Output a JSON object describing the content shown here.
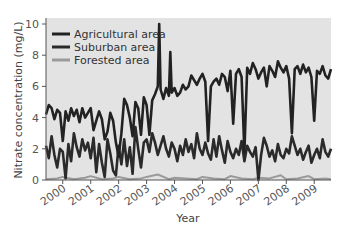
{
  "chart_data": {
    "type": "line",
    "title": "",
    "xlabel": "Year",
    "ylabel": "Nitrate concentration (mg/L)",
    "ylim": [
      0,
      10
    ],
    "yticks": [
      0,
      2,
      4,
      6,
      8,
      10
    ],
    "xlim": [
      1999.4,
      2009.6
    ],
    "xticks": [
      2000,
      2001,
      2002,
      2003,
      2004,
      2005,
      2006,
      2007,
      2008,
      2009
    ],
    "grid": false,
    "background": "#e3e3e3",
    "legend_position": "upper left",
    "series": [
      {
        "name": "Agricultural area",
        "color": "#222222",
        "x": [
          1999.4,
          1999.5,
          1999.6,
          1999.7,
          1999.8,
          1999.9,
          2000.0,
          2000.1,
          2000.2,
          2000.3,
          2000.4,
          2000.5,
          2000.6,
          2000.7,
          2000.8,
          2000.9,
          2001.0,
          2001.1,
          2001.2,
          2001.3,
          2001.4,
          2001.5,
          2001.6,
          2001.7,
          2001.8,
          2001.9,
          2002.0,
          2002.1,
          2002.2,
          2002.3,
          2002.4,
          2002.5,
          2002.6,
          2002.7,
          2002.8,
          2002.9,
          2003.0,
          2003.1,
          2003.2,
          2003.3,
          2003.4,
          2003.45,
          2003.5,
          2003.6,
          2003.7,
          2003.8,
          2003.85,
          2003.9,
          2004.0,
          2004.1,
          2004.2,
          2004.3,
          2004.4,
          2004.5,
          2004.6,
          2004.7,
          2004.8,
          2004.9,
          2005.0,
          2005.1,
          2005.2,
          2005.3,
          2005.4,
          2005.5,
          2005.6,
          2005.7,
          2005.8,
          2005.9,
          2006.0,
          2006.1,
          2006.2,
          2006.3,
          2006.4,
          2006.5,
          2006.6,
          2006.7,
          2006.8,
          2006.9,
          2007.0,
          2007.1,
          2007.2,
          2007.3,
          2007.4,
          2007.5,
          2007.6,
          2007.7,
          2007.8,
          2007.9,
          2008.0,
          2008.1,
          2008.2,
          2008.3,
          2008.4,
          2008.5,
          2008.6,
          2008.7,
          2008.8,
          2008.9,
          2009.0,
          2009.1,
          2009.2,
          2009.3,
          2009.4,
          2009.5,
          2009.6
        ],
        "values": [
          4.2,
          4.8,
          4.6,
          3.9,
          4.5,
          4.3,
          2.5,
          4.4,
          3.8,
          4.6,
          4.1,
          4.5,
          3.7,
          4.6,
          4.0,
          4.3,
          4.6,
          3.2,
          3.8,
          4.4,
          3.9,
          2.6,
          3.1,
          4.3,
          3.8,
          2.4,
          1.5,
          3.0,
          5.2,
          4.8,
          4.0,
          2.8,
          5.0,
          4.6,
          2.9,
          5.3,
          4.8,
          2.9,
          5.1,
          5.5,
          6.0,
          10.0,
          5.8,
          5.2,
          5.9,
          5.4,
          8.2,
          5.6,
          5.9,
          5.4,
          5.6,
          6.1,
          5.8,
          6.0,
          6.7,
          6.4,
          6.1,
          6.5,
          6.8,
          6.3,
          2.5,
          6.0,
          6.3,
          6.5,
          6.1,
          6.8,
          6.6,
          5.7,
          7.0,
          3.6,
          6.8,
          7.1,
          6.6,
          1.8,
          7.2,
          6.8,
          7.5,
          7.1,
          6.5,
          6.9,
          7.2,
          6.0,
          7.3,
          7.0,
          6.6,
          7.6,
          7.2,
          6.9,
          7.3,
          6.5,
          3.0,
          7.1,
          7.3,
          6.8,
          7.4,
          6.9,
          7.2,
          6.6,
          3.8,
          7.0,
          6.8,
          7.3,
          6.7,
          6.5,
          7.1
        ],
        "note": "values approximate; series shows frequent downward spikes"
      },
      {
        "name": "Suburban area",
        "color": "#2a2a2a",
        "x": [
          1999.4,
          1999.5,
          1999.6,
          1999.7,
          1999.8,
          1999.9,
          2000.0,
          2000.1,
          2000.2,
          2000.3,
          2000.4,
          2000.5,
          2000.6,
          2000.7,
          2000.8,
          2000.9,
          2001.0,
          2001.1,
          2001.2,
          2001.3,
          2001.4,
          2001.5,
          2001.6,
          2001.7,
          2001.8,
          2001.9,
          2002.0,
          2002.1,
          2002.2,
          2002.3,
          2002.4,
          2002.5,
          2002.6,
          2002.7,
          2002.8,
          2002.9,
          2003.0,
          2003.1,
          2003.2,
          2003.3,
          2003.4,
          2003.5,
          2003.6,
          2003.7,
          2003.8,
          2003.9,
          2004.0,
          2004.1,
          2004.2,
          2004.3,
          2004.4,
          2004.5,
          2004.6,
          2004.7,
          2004.8,
          2004.9,
          2005.0,
          2005.1,
          2005.2,
          2005.3,
          2005.4,
          2005.5,
          2005.6,
          2005.7,
          2005.8,
          2005.9,
          2006.0,
          2006.1,
          2006.2,
          2006.3,
          2006.4,
          2006.5,
          2006.6,
          2006.7,
          2006.8,
          2006.9,
          2007.0,
          2007.1,
          2007.2,
          2007.3,
          2007.4,
          2007.5,
          2007.6,
          2007.7,
          2007.8,
          2007.9,
          2008.0,
          2008.1,
          2008.2,
          2008.3,
          2008.4,
          2008.5,
          2008.6,
          2008.7,
          2008.8,
          2008.9,
          2009.0,
          2009.1,
          2009.2,
          2009.3,
          2009.4,
          2009.5,
          2009.6
        ],
        "values": [
          2.2,
          1.4,
          2.8,
          1.6,
          0.8,
          2.0,
          1.8,
          0.1,
          2.3,
          1.2,
          3.0,
          2.1,
          1.5,
          2.6,
          1.9,
          2.4,
          1.4,
          2.7,
          0.5,
          2.3,
          1.1,
          0.2,
          2.6,
          1.7,
          0.6,
          0.3,
          2.2,
          1.0,
          2.6,
          0.9,
          2.1,
          0.4,
          3.4,
          2.0,
          0.8,
          2.4,
          2.6,
          1.8,
          3.0,
          2.4,
          1.6,
          2.2,
          2.8,
          2.0,
          1.5,
          2.4,
          2.0,
          1.2,
          2.2,
          1.6,
          2.6,
          1.8,
          2.3,
          1.4,
          3.0,
          2.0,
          1.6,
          2.4,
          1.7,
          1.3,
          2.6,
          1.5,
          2.8,
          1.9,
          1.1,
          2.5,
          1.8,
          1.4,
          2.0,
          1.6,
          2.5,
          1.2,
          2.2,
          1.8,
          1.5,
          2.1,
          0.0,
          1.6,
          2.7,
          2.2,
          1.5,
          1.9,
          1.2,
          2.3,
          1.6,
          1.4,
          2.0,
          1.7,
          2.8,
          2.2,
          1.6,
          2.0,
          1.3,
          1.8,
          2.2,
          1.1,
          1.6,
          2.0,
          1.4,
          2.6,
          1.8,
          1.5,
          2.0
        ],
        "note": "values approximate; fluctuates around 1.5-2.5 mg/L"
      },
      {
        "name": "Forested area",
        "color": "#9a9a9a",
        "x": [
          1999.4,
          1999.8,
          2000.0,
          2000.4,
          2000.8,
          2001.0,
          2001.4,
          2001.8,
          2002.0,
          2002.4,
          2002.8,
          2003.0,
          2003.4,
          2003.8,
          2004.0,
          2004.4,
          2004.8,
          2005.0,
          2005.4,
          2005.8,
          2006.0,
          2006.4,
          2006.8,
          2007.0,
          2007.4,
          2007.8,
          2008.0,
          2008.4,
          2008.8,
          2009.0,
          2009.4,
          2009.6
        ],
        "values": [
          0.05,
          0.1,
          0.2,
          0.05,
          0.15,
          0.25,
          0.05,
          0.1,
          0.2,
          0.05,
          0.1,
          0.2,
          0.35,
          0.05,
          0.15,
          0.1,
          0.05,
          0.2,
          0.1,
          0.05,
          0.25,
          0.1,
          0.05,
          0.15,
          0.1,
          0.3,
          0.05,
          0.1,
          0.25,
          0.05,
          0.1,
          0.05
        ],
        "note": "values approximate; near zero throughout"
      }
    ]
  },
  "axes": {
    "y_title": "Nitrate concentration (mg/L)",
    "x_title": "Year",
    "y_tick_labels": [
      "0",
      "2",
      "4",
      "6",
      "8",
      "10"
    ],
    "x_tick_labels": [
      "2000",
      "2001",
      "2002",
      "2003",
      "2004",
      "2005",
      "2006",
      "2007",
      "2008",
      "2009"
    ]
  },
  "legend": {
    "items": [
      {
        "label": "Agricultural area",
        "color": "#222222"
      },
      {
        "label": "Suburban area",
        "color": "#2a2a2a"
      },
      {
        "label": "Forested area",
        "color": "#9a9a9a"
      }
    ]
  }
}
